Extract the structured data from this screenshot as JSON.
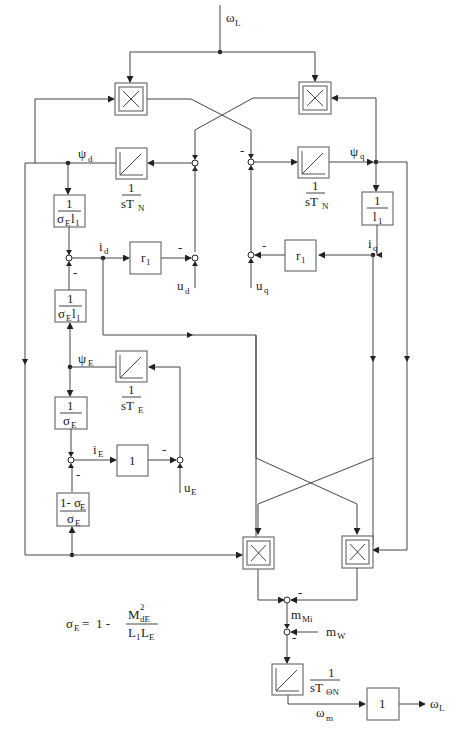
{
  "diagram": {
    "type": "signal-flow block diagram",
    "signals": {
      "omega_L_in": {
        "main": "ω",
        "sub": "L"
      },
      "psi_d": {
        "main": "ψ",
        "sub": "d"
      },
      "psi_q": {
        "main": "ψ",
        "sub": "q"
      },
      "i_d": {
        "main": "i",
        "sub": "d"
      },
      "i_q": {
        "main": "i",
        "sub": "q"
      },
      "u_d": {
        "main": "u",
        "sub": "d"
      },
      "u_q": {
        "main": "u",
        "sub": "q"
      },
      "psi_E": {
        "main": "ψ",
        "sub": "E"
      },
      "i_E": {
        "main": "i",
        "sub": "E"
      },
      "u_E": {
        "main": "u",
        "sub": "E"
      },
      "m_Mi": {
        "main": "m",
        "sub": "Mi"
      },
      "m_W": {
        "main": "m",
        "sub": "W"
      },
      "omega_m": {
        "main": "ω",
        "sub": "m"
      },
      "omega_L_out": {
        "main": "ω",
        "sub": "L"
      }
    },
    "blocks": {
      "mult_top_left": {
        "symbol": "×"
      },
      "mult_top_right": {
        "symbol": "×"
      },
      "mult_bottom_left": {
        "symbol": "×"
      },
      "mult_bottom_right": {
        "symbol": "×"
      },
      "integrator_d": {
        "num": "1",
        "den_main": "sT",
        "den_sub": "N"
      },
      "integrator_q": {
        "num": "1",
        "den_main": "sT",
        "den_sub": "N"
      },
      "integrator_E": {
        "num": "1",
        "den_main": "sT",
        "den_sub": "E"
      },
      "integrator_mech": {
        "num": "1",
        "den_main": "sT",
        "den_sub": "ΘN"
      },
      "gain_inv_sigmaE_l1_top": {
        "num": "1",
        "den_main": "σ",
        "den_sub": "E",
        "den_tail": "l",
        "den_tail_sub": "1"
      },
      "gain_inv_sigmaE_l1_bottom": {
        "num": "1",
        "den_main": "σ",
        "den_sub": "E",
        "den_tail": "l",
        "den_tail_sub": "1"
      },
      "gain_inv_l1": {
        "num": "1",
        "den_main": "l",
        "den_sub": "1"
      },
      "gain_r1_d": {
        "main": "r",
        "sub": "1"
      },
      "gain_r1_q": {
        "main": "r",
        "sub": "1"
      },
      "gain_inv_sigmaE": {
        "num": "1",
        "den_main": "σ",
        "den_sub": "E"
      },
      "gain_one_E": {
        "value": "1"
      },
      "gain_coupling": {
        "num_a": "1- σ",
        "num_sub": "E",
        "den_main": "σ",
        "den_sub": "E"
      },
      "gain_one_out": {
        "value": "1"
      }
    },
    "minus_sign": "-",
    "formula": {
      "lhs_main": "σ",
      "lhs_sub": "E",
      "equals": "=",
      "one_minus": "1 -",
      "num_main": "M",
      "num_sup": "2",
      "num_sub": "dE",
      "den_a": "L",
      "den_a_sub": "1",
      "den_b": "L",
      "den_b_sub": "E"
    }
  }
}
